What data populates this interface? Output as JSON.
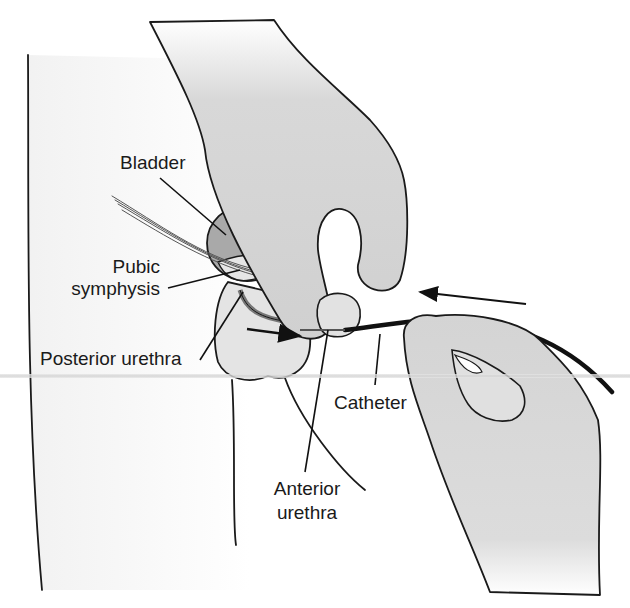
{
  "figure": {
    "colors": {
      "line": "#1a1a1a",
      "skin": "#d9d9d9",
      "bladder": "#a9a9a9",
      "background": "#ffffff"
    },
    "labels": {
      "bladder": "Bladder",
      "pubic_symphysis_line1": "Pubic",
      "pubic_symphysis_line2": "symphysis",
      "posterior_urethra": "Posterior urethra",
      "catheter": "Catheter",
      "anterior_urethra_line1": "Anterior",
      "anterior_urethra_line2": "urethra"
    },
    "arrows": [
      {
        "name": "insertion-direction-arrow",
        "direction": "left"
      },
      {
        "name": "urethra-direction-arrow",
        "direction": "right"
      }
    ]
  }
}
